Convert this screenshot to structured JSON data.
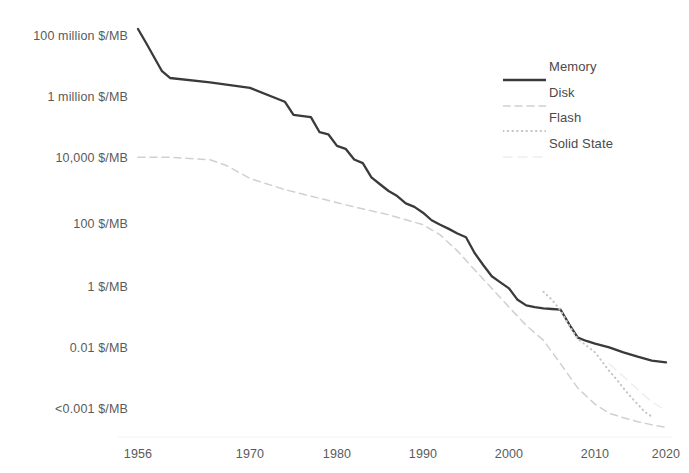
{
  "chart_data": {
    "type": "line",
    "title": "",
    "subtitle": "",
    "xlabel": "",
    "ylabel": "",
    "grid": false,
    "legend_position": "top-right",
    "x_ticks": [
      "1956",
      "1970",
      "1980",
      "1990",
      "2000",
      "2010",
      "2020"
    ],
    "x_tick_values": [
      1956,
      1970,
      1980,
      1990,
      2000,
      2010,
      2020
    ],
    "xlim": [
      1956,
      2022
    ],
    "y_ticks": [
      "100 million $/MB",
      "1 million $/MB",
      "10,000 $/MB",
      "100 $/MB",
      "1 $/MB",
      "0.01 $/MB",
      "<0.001 $/MB"
    ],
    "y_tick_values": [
      100000000,
      1000000,
      10000,
      100,
      1,
      0.01,
      0.001
    ],
    "y_scale": "log",
    "ylim": [
      0.0005,
      300000000
    ],
    "series": [
      {
        "name": "Memory",
        "style": "solid",
        "color": "#3a3a3a",
        "points": [
          [
            1956,
            170000000
          ],
          [
            1957,
            60000000
          ],
          [
            1959,
            7000000
          ],
          [
            1960,
            4200000
          ],
          [
            1965,
            3000000
          ],
          [
            1970,
            2000000
          ],
          [
            1974,
            700000
          ],
          [
            1975,
            260000
          ],
          [
            1977,
            220000
          ],
          [
            1978,
            70000
          ],
          [
            1979,
            60000
          ],
          [
            1980,
            25000
          ],
          [
            1981,
            20000
          ],
          [
            1982,
            9000
          ],
          [
            1983,
            7000
          ],
          [
            1984,
            2600
          ],
          [
            1985,
            1600
          ],
          [
            1986,
            1000
          ],
          [
            1987,
            700
          ],
          [
            1988,
            420
          ],
          [
            1989,
            330
          ],
          [
            1990,
            220
          ],
          [
            1991,
            130
          ],
          [
            1992,
            95
          ],
          [
            1993,
            70
          ],
          [
            1994,
            50
          ],
          [
            1995,
            38
          ],
          [
            1996,
            12
          ],
          [
            1997,
            5
          ],
          [
            1998,
            2.2
          ],
          [
            1999,
            1.4
          ],
          [
            2000,
            0.9
          ],
          [
            2001,
            0.38
          ],
          [
            2002,
            0.25
          ],
          [
            2003,
            0.22
          ],
          [
            2004,
            0.2
          ],
          [
            2005,
            0.19
          ],
          [
            2006,
            0.18
          ],
          [
            2007,
            0.06
          ],
          [
            2008,
            0.022
          ],
          [
            2009,
            0.017
          ],
          [
            2010,
            0.014
          ],
          [
            2012,
            0.0105
          ],
          [
            2014,
            0.0085
          ],
          [
            2016,
            0.0072
          ],
          [
            2018,
            0.0062
          ],
          [
            2020,
            0.0058
          ]
        ]
      },
      {
        "name": "Disk",
        "style": "dashed",
        "color": "#d0d0d0",
        "points": [
          [
            1956,
            10500
          ],
          [
            1960,
            10500
          ],
          [
            1963,
            9500
          ],
          [
            1965,
            8800
          ],
          [
            1967,
            6000
          ],
          [
            1970,
            2400
          ],
          [
            1974,
            1100
          ],
          [
            1978,
            600
          ],
          [
            1982,
            330
          ],
          [
            1986,
            190
          ],
          [
            1990,
            95
          ],
          [
            1992,
            45
          ],
          [
            1994,
            14
          ],
          [
            1996,
            3.5
          ],
          [
            1998,
            0.9
          ],
          [
            2000,
            0.22
          ],
          [
            2002,
            0.055
          ],
          [
            2004,
            0.018
          ],
          [
            2006,
            0.0055
          ],
          [
            2008,
            0.0022
          ],
          [
            2010,
            0.0012
          ],
          [
            2012,
            0.00085
          ],
          [
            2014,
            0.00072
          ],
          [
            2016,
            0.00062
          ],
          [
            2018,
            0.00055
          ],
          [
            2020,
            0.0005
          ]
        ]
      },
      {
        "name": "Flash",
        "style": "dotted",
        "color": "#c4c4c4",
        "points": [
          [
            2004,
            0.7
          ],
          [
            2005,
            0.38
          ],
          [
            2006,
            0.17
          ],
          [
            2007,
            0.055
          ],
          [
            2008,
            0.02
          ],
          [
            2009,
            0.012
          ],
          [
            2010,
            0.0085
          ],
          [
            2011,
            0.006
          ],
          [
            2012,
            0.0042
          ],
          [
            2013,
            0.0031
          ],
          [
            2014,
            0.0022
          ],
          [
            2015,
            0.0016
          ],
          [
            2016,
            0.0012
          ],
          [
            2017,
            0.0009
          ],
          [
            2018,
            0.00075
          ]
        ]
      },
      {
        "name": "Solid State",
        "style": "faint",
        "color": "#eeeeee",
        "points": [
          [
            2012,
            0.0055
          ],
          [
            2014,
            0.0034
          ],
          [
            2016,
            0.0021
          ],
          [
            2018,
            0.0013
          ],
          [
            2020,
            0.00095
          ]
        ]
      }
    ]
  },
  "legend": {
    "items": [
      {
        "label": "Memory"
      },
      {
        "label": "Disk"
      },
      {
        "label": "Flash"
      },
      {
        "label": "Solid State"
      }
    ]
  }
}
